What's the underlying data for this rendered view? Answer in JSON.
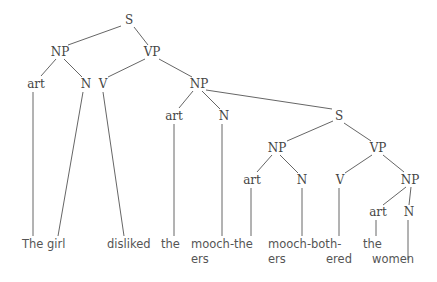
{
  "diagram": {
    "type": "syntax-tree",
    "nodes": {
      "s_root": "S",
      "np_subj": "NP",
      "vp_main": "VP",
      "art_1": "art",
      "n_1": "N",
      "v_1": "V",
      "np_obj": "NP",
      "art_2": "art",
      "n_2": "N",
      "s_rel": "S",
      "np_rel": "NP",
      "vp_rel": "VP",
      "art_3": "art",
      "n_3": "N",
      "v_3": "V",
      "np_rel_obj": "NP",
      "art_4": "art",
      "n_4": "N"
    },
    "leaves": {
      "the_girl": "The girl",
      "disliked": "disliked",
      "the_1": "the",
      "mooch_the_1": "mooch-the",
      "ers_1": "ers",
      "mooch_both": "mooch-both-",
      "ers_2": "ers",
      "ered": "ered",
      "the_2": "the",
      "women": "women"
    },
    "line_color": "#666666"
  }
}
